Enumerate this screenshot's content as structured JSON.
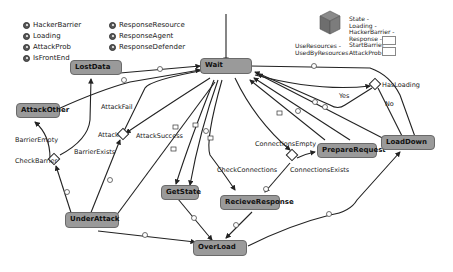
{
  "legend": {
    "left": [
      {
        "name": "HackerBarrier",
        "icon": "parameter-icon"
      },
      {
        "name": "Loading",
        "icon": "parameter-icon"
      },
      {
        "name": "AttackProb",
        "icon": "parameter-icon"
      },
      {
        "name": "IsFrontEnd",
        "icon": "parameter-icon"
      }
    ],
    "right": [
      {
        "name": "ResponseResource",
        "icon": "parameter-icon"
      },
      {
        "name": "ResponseAgent",
        "icon": "parameter-icon"
      },
      {
        "name": "ResponseDefender",
        "icon": "parameter-icon"
      }
    ]
  },
  "resource_legend": {
    "icon": "resource-cube-icon",
    "use_label_1": "UseResources -",
    "use_label_2": "UsedByResources",
    "state_lines": [
      "State -",
      "Loading -",
      "HackerBarrier -",
      "Response -",
      "StartBarrier"
    ],
    "attack_prob_label": "AttackProb"
  },
  "states": {
    "wait": "Wait",
    "lost_data": "LostData",
    "attack_other": "AttackOther",
    "under_attack": "UnderAttack",
    "get_state": "GetState",
    "recieve_response": "RecieveResponse",
    "prepare_request": "PrepareRequest",
    "load_down": "LoadDown",
    "over_load": "OverLoad"
  },
  "branches": {
    "has_loading": "HasLoading",
    "attack": "Attack",
    "check_barrier": "CheckBarrier",
    "check_connections": "CheckConnections"
  },
  "transition_labels": {
    "yes": "Yes",
    "no": "No",
    "attack_fail": "AttackFail",
    "attack_success": "AttackSuccess",
    "barrier_empty": "BarrierEmpty",
    "barrier_exists": "BarrierExists",
    "connections_empty": "ConnectionsEmpty",
    "connections_exists": "ConnectionsExists"
  },
  "colors": {
    "state_fill": "#9a9a9a",
    "state_border": "#6a6a6a",
    "edge": "#222222",
    "background": "#ffffff"
  }
}
